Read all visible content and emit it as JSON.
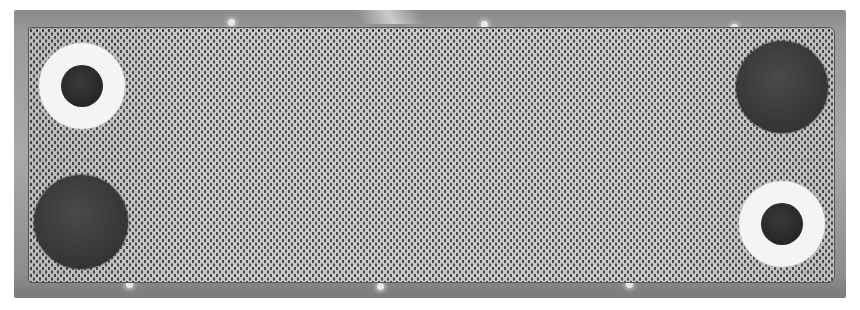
{
  "image": {
    "subject": "Plate heat exchanger plate with corrugated mesh pattern and four ports",
    "style": "grayscale photograph",
    "colors": {
      "background": "#ffffff",
      "gasket_frame": "#9a9a9a",
      "plate_light": "#cfcfcf",
      "plate_dark_dots": "#4a4a4a",
      "ring_gasket": "#f4f4f4",
      "port_bore": "#262626",
      "open_port": "#383838"
    },
    "ports": [
      {
        "position": "top-left",
        "type": "ringed",
        "cx": 82,
        "cy": 86,
        "outer_r": 43,
        "inner_r": 21
      },
      {
        "position": "top-right",
        "type": "open",
        "cx": 782,
        "cy": 87,
        "r": 46
      },
      {
        "position": "bottom-left",
        "type": "open",
        "cx": 81,
        "cy": 222,
        "r": 47
      },
      {
        "position": "bottom-right",
        "type": "ringed",
        "cx": 782,
        "cy": 224,
        "outer_r": 43,
        "inner_r": 21
      }
    ]
  }
}
